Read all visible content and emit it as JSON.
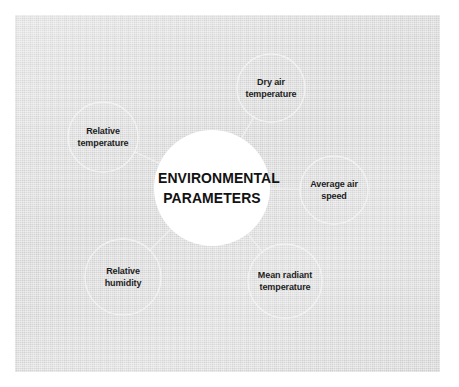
{
  "diagram": {
    "type": "radial-mind-map",
    "background_color": "#dcdcdc",
    "panel_color": "#d9d9d9",
    "center_circle_color": "#ffffff",
    "node_outline_color": "#f2f2f2",
    "connector_color": "#f0f0f0",
    "text_color": "#1d1d1d",
    "center": {
      "id": "environmental-parameters",
      "line1": "ENVIRONMENTAL",
      "line2": "PARAMETERS",
      "cx": 212,
      "cy": 188,
      "r": 58
    },
    "nodes": [
      {
        "id": "dry-air-temperature",
        "line1": "Dry air",
        "line2": "temperature",
        "cx": 271,
        "cy": 88,
        "r": 34
      },
      {
        "id": "relative-temperature",
        "line1": "Relative",
        "line2": "temperature",
        "cx": 103,
        "cy": 137,
        "r": 35
      },
      {
        "id": "average-air-speed",
        "line1": "Average air",
        "line2": "speed",
        "cx": 334,
        "cy": 190,
        "r": 34
      },
      {
        "id": "mean-radiant-temperature",
        "line1": "Mean radiant",
        "line2": "temperature",
        "cx": 285,
        "cy": 281,
        "r": 37
      },
      {
        "id": "relative-humidity",
        "line1": "Relative",
        "line2": "humidity",
        "cx": 123,
        "cy": 277,
        "r": 38
      }
    ]
  }
}
